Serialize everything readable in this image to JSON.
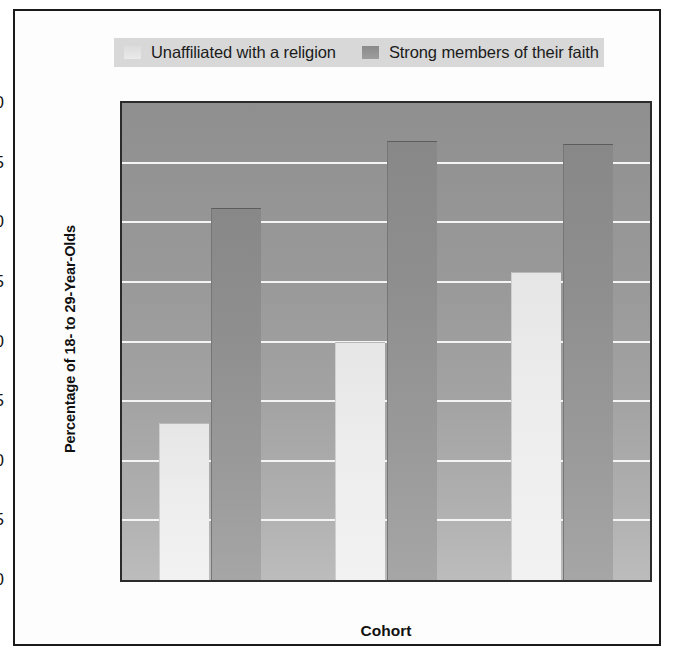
{
  "figure": {
    "background_color": "#fdfdfd",
    "frame_color": "#1a1a1a",
    "plot_background_color": "#9a9a9a",
    "gridline_color": "#f4f4f4"
  },
  "legend": {
    "background_color": "#d8d8d8",
    "position": "top",
    "entries": [
      {
        "label": "Unaffiliated with a religion",
        "swatch": "light",
        "color": "#ededed"
      },
      {
        "label": "Strong members of their faith",
        "swatch": "dark",
        "color": "#939393"
      }
    ]
  },
  "chart_data": {
    "type": "bar",
    "title": "",
    "xlabel": "Cohort",
    "ylabel": "Percentage of 18- to 29-Year-Olds",
    "categories": [
      "1970s",
      "1990s",
      "2000s"
    ],
    "series": [
      {
        "name": "Unaffiliated with a religion",
        "color": "#ededed",
        "values": [
          13.2,
          20.0,
          25.8
        ]
      },
      {
        "name": "Strong members of their faith",
        "color": "#939393",
        "values": [
          31.2,
          36.8,
          36.6
        ]
      }
    ],
    "ylim": [
      0,
      40
    ],
    "yticks": [
      0,
      5,
      10,
      15,
      20,
      25,
      30,
      35,
      40
    ],
    "ytick_labels": [
      "0",
      "5",
      "10",
      "15",
      "20",
      "25",
      "30",
      "35",
      "40"
    ],
    "grid": true,
    "grid_axis": "y",
    "legend_position": "top"
  }
}
